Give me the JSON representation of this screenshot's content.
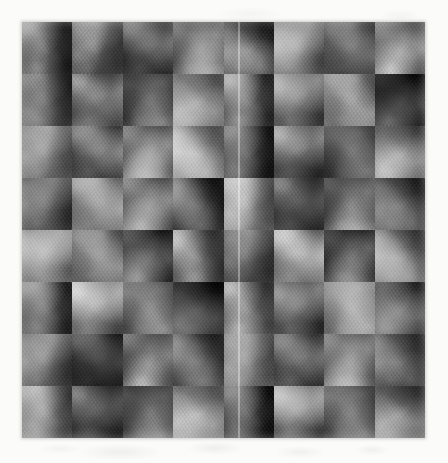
{
  "page": {
    "width": 448,
    "height": 463,
    "background_color": "#fbfbfa"
  },
  "figure": {
    "name": "texture-mosaic",
    "caption": "",
    "x": 22,
    "y": 22,
    "width": 403,
    "height": 416,
    "grid_columns": 8,
    "grid_rows": 8,
    "tile_width": 50,
    "tile_height": 52,
    "base_color": "#6b6b6b",
    "mean_gray_level": 107,
    "min_gray_level": 18,
    "max_gray_level": 236,
    "seam": {
      "name": "vertical-seam",
      "orientation": "vertical",
      "x": 238,
      "color": "#ffffff",
      "description": "bright vertical join line spanning the full figure height"
    },
    "tiles": [
      {
        "row": 0,
        "col": 0,
        "gray": 108,
        "hue_rotate": 0,
        "bright": 0.98,
        "contrast": 1.05,
        "rot": 12
      },
      {
        "row": 0,
        "col": 1,
        "gray": 120,
        "hue_rotate": 0,
        "bright": 1.08,
        "contrast": 0.95,
        "rot": 47
      },
      {
        "row": 0,
        "col": 2,
        "gray": 96,
        "hue_rotate": 0,
        "bright": 0.88,
        "contrast": 1.12,
        "rot": 128
      },
      {
        "row": 0,
        "col": 3,
        "gray": 112,
        "hue_rotate": 0,
        "bright": 1.02,
        "contrast": 1.0,
        "rot": 210
      },
      {
        "row": 0,
        "col": 4,
        "gray": 88,
        "hue_rotate": 0,
        "bright": 0.82,
        "contrast": 1.15,
        "rot": 304
      },
      {
        "row": 0,
        "col": 5,
        "gray": 118,
        "hue_rotate": 0,
        "bright": 1.06,
        "contrast": 0.98,
        "rot": 75
      },
      {
        "row": 0,
        "col": 6,
        "gray": 100,
        "hue_rotate": 0,
        "bright": 0.92,
        "contrast": 1.08,
        "rot": 163
      },
      {
        "row": 0,
        "col": 7,
        "gray": 126,
        "hue_rotate": 0,
        "bright": 1.14,
        "contrast": 0.93,
        "rot": 251
      },
      {
        "row": 1,
        "col": 0,
        "gray": 104,
        "hue_rotate": 0,
        "bright": 0.95,
        "contrast": 1.06,
        "rot": 33
      },
      {
        "row": 1,
        "col": 1,
        "gray": 114,
        "hue_rotate": 0,
        "bright": 1.04,
        "contrast": 0.99,
        "rot": 119
      },
      {
        "row": 1,
        "col": 2,
        "gray": 92,
        "hue_rotate": 0,
        "bright": 0.85,
        "contrast": 1.14,
        "rot": 198
      },
      {
        "row": 1,
        "col": 3,
        "gray": 122,
        "hue_rotate": 0,
        "bright": 1.1,
        "contrast": 0.96,
        "rot": 286
      },
      {
        "row": 1,
        "col": 4,
        "gray": 98,
        "hue_rotate": 0,
        "bright": 0.9,
        "contrast": 1.1,
        "rot": 8
      },
      {
        "row": 1,
        "col": 5,
        "gray": 110,
        "hue_rotate": 0,
        "bright": 1.0,
        "contrast": 1.02,
        "rot": 95
      },
      {
        "row": 1,
        "col": 6,
        "gray": 132,
        "hue_rotate": 0,
        "bright": 1.2,
        "contrast": 0.9,
        "rot": 174
      },
      {
        "row": 1,
        "col": 7,
        "gray": 86,
        "hue_rotate": 0,
        "bright": 0.8,
        "contrast": 1.18,
        "rot": 262
      },
      {
        "row": 2,
        "col": 0,
        "gray": 116,
        "hue_rotate": 0,
        "bright": 1.05,
        "contrast": 0.97,
        "rot": 54
      },
      {
        "row": 2,
        "col": 1,
        "gray": 94,
        "hue_rotate": 0,
        "bright": 0.86,
        "contrast": 1.13,
        "rot": 141
      },
      {
        "row": 2,
        "col": 2,
        "gray": 106,
        "hue_rotate": 0,
        "bright": 0.97,
        "contrast": 1.04,
        "rot": 229
      },
      {
        "row": 2,
        "col": 3,
        "gray": 128,
        "hue_rotate": 0,
        "bright": 1.16,
        "contrast": 0.92,
        "rot": 317
      },
      {
        "row": 2,
        "col": 4,
        "gray": 90,
        "hue_rotate": 0,
        "bright": 0.83,
        "contrast": 1.16,
        "rot": 22
      },
      {
        "row": 2,
        "col": 5,
        "gray": 112,
        "hue_rotate": 0,
        "bright": 1.01,
        "contrast": 1.01,
        "rot": 110
      },
      {
        "row": 2,
        "col": 6,
        "gray": 102,
        "hue_rotate": 0,
        "bright": 0.93,
        "contrast": 1.07,
        "rot": 188
      },
      {
        "row": 2,
        "col": 7,
        "gray": 124,
        "hue_rotate": 0,
        "bright": 1.12,
        "contrast": 0.94,
        "rot": 276
      },
      {
        "row": 3,
        "col": 0,
        "gray": 98,
        "hue_rotate": 0,
        "bright": 0.9,
        "contrast": 1.11,
        "rot": 66
      },
      {
        "row": 3,
        "col": 1,
        "gray": 120,
        "hue_rotate": 0,
        "bright": 1.08,
        "contrast": 0.96,
        "rot": 154
      },
      {
        "row": 3,
        "col": 2,
        "gray": 108,
        "hue_rotate": 0,
        "bright": 0.99,
        "contrast": 1.03,
        "rot": 242
      },
      {
        "row": 3,
        "col": 3,
        "gray": 88,
        "hue_rotate": 0,
        "bright": 0.81,
        "contrast": 1.17,
        "rot": 330
      },
      {
        "row": 3,
        "col": 4,
        "gray": 130,
        "hue_rotate": 0,
        "bright": 1.18,
        "contrast": 0.91,
        "rot": 39
      },
      {
        "row": 3,
        "col": 5,
        "gray": 100,
        "hue_rotate": 0,
        "bright": 0.91,
        "contrast": 1.09,
        "rot": 127
      },
      {
        "row": 3,
        "col": 6,
        "gray": 114,
        "hue_rotate": 0,
        "bright": 1.03,
        "contrast": 1.0,
        "rot": 215
      },
      {
        "row": 3,
        "col": 7,
        "gray": 96,
        "hue_rotate": 0,
        "bright": 0.88,
        "contrast": 1.12,
        "rot": 303
      },
      {
        "row": 4,
        "col": 0,
        "gray": 122,
        "hue_rotate": 0,
        "bright": 1.1,
        "contrast": 0.95,
        "rot": 81
      },
      {
        "row": 4,
        "col": 1,
        "gray": 104,
        "hue_rotate": 0,
        "bright": 0.95,
        "contrast": 1.06,
        "rot": 169
      },
      {
        "row": 4,
        "col": 2,
        "gray": 92,
        "hue_rotate": 0,
        "bright": 0.84,
        "contrast": 1.15,
        "rot": 257
      },
      {
        "row": 4,
        "col": 3,
        "gray": 116,
        "hue_rotate": 0,
        "bright": 1.05,
        "contrast": 0.98,
        "rot": 345
      },
      {
        "row": 4,
        "col": 4,
        "gray": 106,
        "hue_rotate": 0,
        "bright": 0.97,
        "contrast": 1.04,
        "rot": 51
      },
      {
        "row": 4,
        "col": 5,
        "gray": 134,
        "hue_rotate": 0,
        "bright": 1.22,
        "contrast": 0.89,
        "rot": 139
      },
      {
        "row": 4,
        "col": 6,
        "gray": 86,
        "hue_rotate": 0,
        "bright": 0.79,
        "contrast": 1.19,
        "rot": 227
      },
      {
        "row": 4,
        "col": 7,
        "gray": 110,
        "hue_rotate": 0,
        "bright": 1.0,
        "contrast": 1.02,
        "rot": 315
      },
      {
        "row": 5,
        "col": 0,
        "gray": 94,
        "hue_rotate": 0,
        "bright": 0.86,
        "contrast": 1.13,
        "rot": 18
      },
      {
        "row": 5,
        "col": 1,
        "gray": 126,
        "hue_rotate": 0,
        "bright": 1.14,
        "contrast": 0.93,
        "rot": 106
      },
      {
        "row": 5,
        "col": 2,
        "gray": 112,
        "hue_rotate": 0,
        "bright": 1.01,
        "contrast": 1.01,
        "rot": 194
      },
      {
        "row": 5,
        "col": 3,
        "gray": 90,
        "hue_rotate": 0,
        "bright": 0.82,
        "contrast": 1.16,
        "rot": 282
      },
      {
        "row": 5,
        "col": 4,
        "gray": 118,
        "hue_rotate": 0,
        "bright": 1.07,
        "contrast": 0.97,
        "rot": 10
      },
      {
        "row": 5,
        "col": 5,
        "gray": 102,
        "hue_rotate": 0,
        "bright": 0.93,
        "contrast": 1.08,
        "rot": 98
      },
      {
        "row": 5,
        "col": 6,
        "gray": 128,
        "hue_rotate": 0,
        "bright": 1.16,
        "contrast": 0.92,
        "rot": 186
      },
      {
        "row": 5,
        "col": 7,
        "gray": 98,
        "hue_rotate": 0,
        "bright": 0.89,
        "contrast": 1.1,
        "rot": 274
      },
      {
        "row": 6,
        "col": 0,
        "gray": 110,
        "hue_rotate": 0,
        "bright": 1.0,
        "contrast": 1.02,
        "rot": 62
      },
      {
        "row": 6,
        "col": 1,
        "gray": 88,
        "hue_rotate": 0,
        "bright": 0.8,
        "contrast": 1.18,
        "rot": 150
      },
      {
        "row": 6,
        "col": 2,
        "gray": 124,
        "hue_rotate": 0,
        "bright": 1.12,
        "contrast": 0.94,
        "rot": 238
      },
      {
        "row": 6,
        "col": 3,
        "gray": 100,
        "hue_rotate": 0,
        "bright": 0.91,
        "contrast": 1.09,
        "rot": 326
      },
      {
        "row": 6,
        "col": 4,
        "gray": 114,
        "hue_rotate": 0,
        "bright": 1.03,
        "contrast": 1.0,
        "rot": 44
      },
      {
        "row": 6,
        "col": 5,
        "gray": 92,
        "hue_rotate": 0,
        "bright": 0.84,
        "contrast": 1.15,
        "rot": 132
      },
      {
        "row": 6,
        "col": 6,
        "gray": 120,
        "hue_rotate": 0,
        "bright": 1.09,
        "contrast": 0.96,
        "rot": 220
      },
      {
        "row": 6,
        "col": 7,
        "gray": 106,
        "hue_rotate": 0,
        "bright": 0.96,
        "contrast": 1.05,
        "rot": 308
      },
      {
        "row": 7,
        "col": 0,
        "gray": 118,
        "hue_rotate": 0,
        "bright": 1.07,
        "contrast": 0.97,
        "rot": 27
      },
      {
        "row": 7,
        "col": 1,
        "gray": 96,
        "hue_rotate": 0,
        "bright": 0.87,
        "contrast": 1.12,
        "rot": 115
      },
      {
        "row": 7,
        "col": 2,
        "gray": 108,
        "hue_rotate": 0,
        "bright": 0.98,
        "contrast": 1.03,
        "rot": 203
      },
      {
        "row": 7,
        "col": 3,
        "gray": 130,
        "hue_rotate": 0,
        "bright": 1.18,
        "contrast": 0.91,
        "rot": 291
      },
      {
        "row": 7,
        "col": 4,
        "gray": 84,
        "hue_rotate": 0,
        "bright": 0.78,
        "contrast": 1.2,
        "rot": 19
      },
      {
        "row": 7,
        "col": 5,
        "gray": 112,
        "hue_rotate": 0,
        "bright": 1.01,
        "contrast": 1.01,
        "rot": 107
      },
      {
        "row": 7,
        "col": 6,
        "gray": 102,
        "hue_rotate": 0,
        "bright": 0.93,
        "contrast": 1.07,
        "rot": 195
      },
      {
        "row": 7,
        "col": 7,
        "gray": 122,
        "hue_rotate": 0,
        "bright": 1.1,
        "contrast": 0.95,
        "rot": 283
      }
    ]
  }
}
